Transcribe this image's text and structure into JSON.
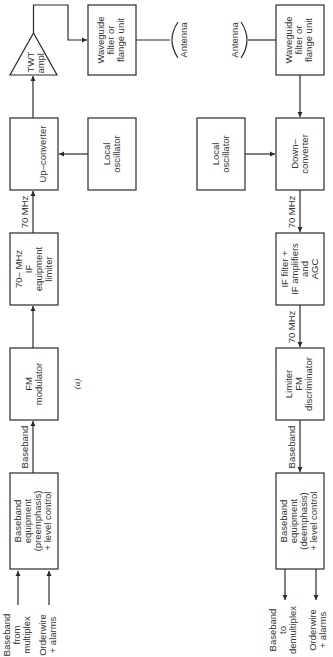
{
  "diagram": {
    "caption": "(a)",
    "orientation": "rotated 90° counter-clockwise",
    "transmit_chain": {
      "inputs": [
        {
          "lines": [
            "Baseband",
            "from",
            "multiplex"
          ]
        },
        {
          "lines": [
            "Orderwire",
            "+ alarms"
          ]
        }
      ],
      "blocks": [
        {
          "id": "tx-baseband",
          "lines": [
            "Baseband",
            "equipment",
            "(preemphasis)",
            "+ level control"
          ]
        },
        {
          "id": "fm-modulator",
          "lines": [
            "FM",
            "modulator"
          ]
        },
        {
          "id": "if-limiter",
          "lines": [
            "70– MHz",
            "IF",
            "equipment",
            "limiter"
          ]
        },
        {
          "id": "up-converter",
          "lines": [
            "Up–converter"
          ]
        },
        {
          "id": "tx-local-oscillator",
          "lines": [
            "Local",
            "oscillator"
          ]
        },
        {
          "id": "twt-amplifier",
          "lines": [
            "TWT",
            "ampl."
          ]
        },
        {
          "id": "tx-waveguide",
          "lines": [
            "Waveguide",
            "filter or",
            "flange unit"
          ]
        },
        {
          "id": "tx-antenna",
          "lines": [
            "Antenna"
          ]
        }
      ],
      "link_labels": {
        "baseband": "Baseband",
        "if_70": "70 MHz"
      }
    },
    "receive_chain": {
      "blocks": [
        {
          "id": "rx-antenna",
          "lines": [
            "Antenna"
          ]
        },
        {
          "id": "rx-waveguide",
          "lines": [
            "Waveguide",
            "filter or",
            "flange unit"
          ]
        },
        {
          "id": "rx-local-oscillator",
          "lines": [
            "Local",
            "oscillator"
          ]
        },
        {
          "id": "down-converter",
          "lines": [
            "Down–",
            "converter"
          ]
        },
        {
          "id": "if-filter-agc",
          "lines": [
            "IF filter +",
            "IF amplifiers",
            "and",
            "AGC"
          ]
        },
        {
          "id": "limiter-discriminator",
          "lines": [
            "Limiter",
            "FM",
            "discriminator"
          ]
        },
        {
          "id": "rx-baseband",
          "lines": [
            "Baseband",
            "equipment",
            "(deemphasis)",
            "+ level control"
          ]
        }
      ],
      "outputs": [
        {
          "lines": [
            "Baseband",
            "to",
            "demultiplex"
          ]
        },
        {
          "lines": [
            "Orderwire",
            "+ alarms"
          ]
        }
      ],
      "link_labels": {
        "if_70_a": "70 MHz",
        "if_70_b": "70 MHz",
        "baseband": "Baseband"
      }
    }
  }
}
